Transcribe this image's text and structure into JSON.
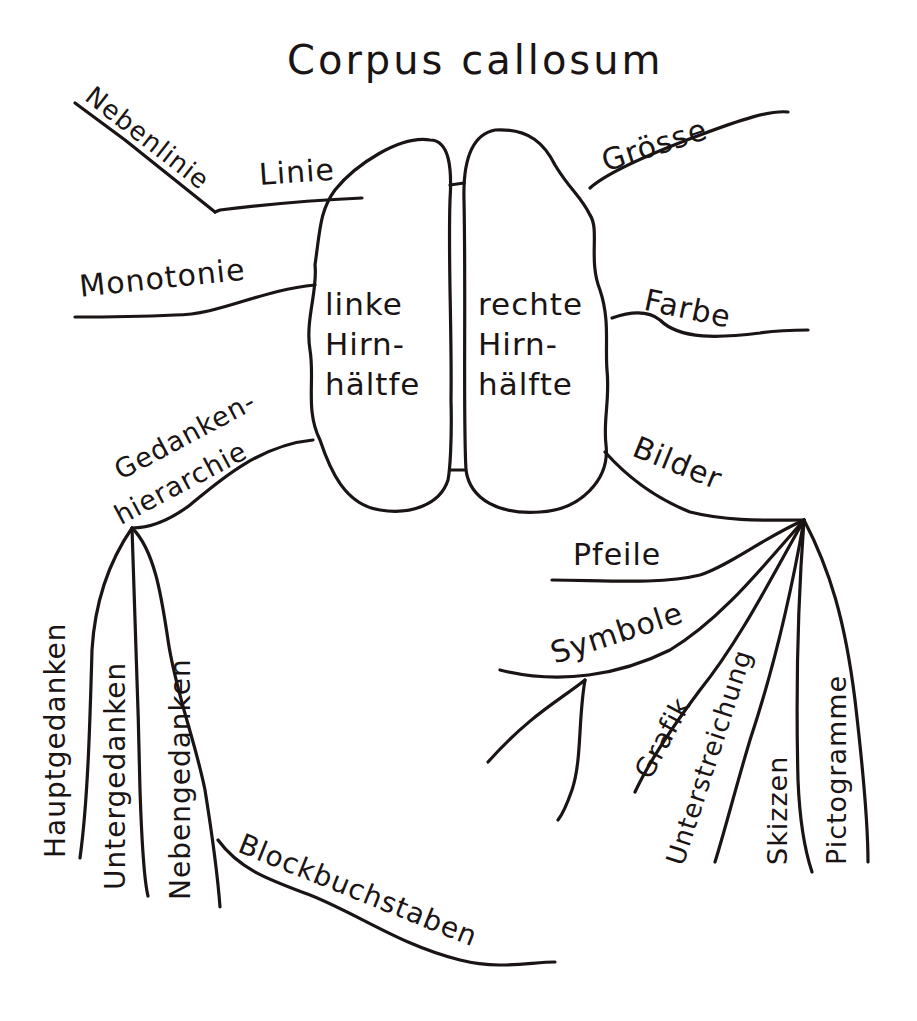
{
  "diagram": {
    "type": "mind-map",
    "title": "Corpus callosum",
    "center": {
      "left_hemisphere": "linke\nHirn-\nhältfe",
      "right_hemisphere": "rechte\nHirn-\nhälfte"
    },
    "left_branches": [
      {
        "label": "Nebenlinie"
      },
      {
        "label": "Linie"
      },
      {
        "label": "Monotonie"
      },
      {
        "label": "Gedanken-\nhierarchie",
        "line1": "Gedanken-",
        "line2": "hierarchie",
        "children": [
          "Hauptgedanken",
          "Untergedanken",
          "Nebengedanken",
          "Blockbuchstaben"
        ]
      }
    ],
    "right_branches": [
      {
        "label": "Grösse"
      },
      {
        "label": "Farbe"
      },
      {
        "label": "Bilder",
        "children": [
          "Pfeile",
          "Symbole",
          "Grafik",
          "Unterstreichung",
          "Skizzen",
          "Pictogramme"
        ]
      }
    ],
    "colors": {
      "ink": "#1a1414",
      "paper": "#ffffff"
    }
  }
}
